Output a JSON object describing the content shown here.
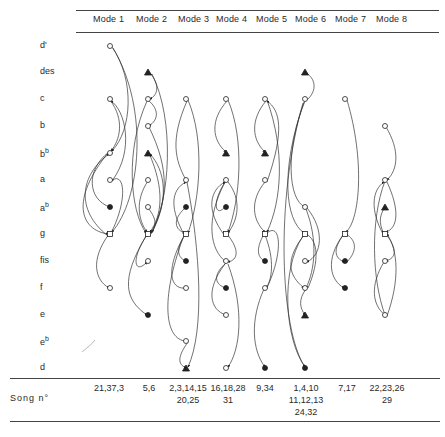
{
  "header": {
    "modes": [
      "Mode 1",
      "Mode 2",
      "Mode 3",
      "Mode 4",
      "Mode 5",
      "Mode 6",
      "Mode 7",
      "Mode 8"
    ]
  },
  "pitches": [
    {
      "name": "d'",
      "base": "d'",
      "sup": ""
    },
    {
      "name": "des",
      "base": "des",
      "sup": ""
    },
    {
      "name": "c",
      "base": "c",
      "sup": ""
    },
    {
      "name": "b",
      "base": "b",
      "sup": ""
    },
    {
      "name": "bb",
      "base": "b",
      "sup": "b"
    },
    {
      "name": "a",
      "base": "a",
      "sup": ""
    },
    {
      "name": "ab",
      "base": "a",
      "sup": "b"
    },
    {
      "name": "g",
      "base": "g",
      "sup": ""
    },
    {
      "name": "fis",
      "base": "fis",
      "sup": ""
    },
    {
      "name": "f",
      "base": "f",
      "sup": ""
    },
    {
      "name": "e",
      "base": "e",
      "sup": ""
    },
    {
      "name": "eb",
      "base": "e",
      "sup": "b"
    },
    {
      "name": "d",
      "base": "d",
      "sup": ""
    }
  ],
  "footer": {
    "song_label": "Song  n°",
    "songs": [
      "21,37,3",
      "5,6",
      "2,3,14,15\n20,25",
      "16,18,28\n31",
      "9,34",
      "1,4,10\n11,12,13\n24,32",
      "7,17",
      "22,23,26\n29"
    ]
  },
  "legend_markers": {
    "open_circle": "tone",
    "filled_circle": "final/end tone",
    "open_square": "central tone",
    "filled_triangle": "upper/lower neighbor"
  },
  "modes": [
    {
      "mode": "Mode 1",
      "nodes": [
        {
          "pitch": "d'",
          "shape": "circle"
        },
        {
          "pitch": "c",
          "shape": "circle"
        },
        {
          "pitch": "bb",
          "shape": "circle"
        },
        {
          "pitch": "a",
          "shape": "circle"
        },
        {
          "pitch": "ab",
          "shape": "filled"
        },
        {
          "pitch": "g",
          "shape": "square"
        },
        {
          "pitch": "f",
          "shape": "circle"
        }
      ]
    },
    {
      "mode": "Mode 2",
      "nodes": [
        {
          "pitch": "des",
          "shape": "triangle"
        },
        {
          "pitch": "c",
          "shape": "circle"
        },
        {
          "pitch": "b",
          "shape": "circle"
        },
        {
          "pitch": "bb",
          "shape": "triangle"
        },
        {
          "pitch": "a",
          "shape": "circle"
        },
        {
          "pitch": "ab",
          "shape": "circle"
        },
        {
          "pitch": "g",
          "shape": "square"
        },
        {
          "pitch": "fis",
          "shape": "circle"
        },
        {
          "pitch": "e",
          "shape": "filled"
        }
      ]
    },
    {
      "mode": "Mode 3",
      "nodes": [
        {
          "pitch": "c",
          "shape": "circle"
        },
        {
          "pitch": "a",
          "shape": "circle"
        },
        {
          "pitch": "ab",
          "shape": "filled"
        },
        {
          "pitch": "g",
          "shape": "square"
        },
        {
          "pitch": "fis",
          "shape": "filled"
        },
        {
          "pitch": "f",
          "shape": "circle"
        },
        {
          "pitch": "e",
          "shape": "circle"
        },
        {
          "pitch": "eb",
          "shape": "circle"
        },
        {
          "pitch": "d",
          "shape": "triangle"
        }
      ]
    },
    {
      "mode": "Mode 4",
      "nodes": [
        {
          "pitch": "c",
          "shape": "circle"
        },
        {
          "pitch": "bb",
          "shape": "triangle"
        },
        {
          "pitch": "a",
          "shape": "circle"
        },
        {
          "pitch": "ab",
          "shape": "filled"
        },
        {
          "pitch": "g",
          "shape": "square"
        },
        {
          "pitch": "fis",
          "shape": "circle"
        },
        {
          "pitch": "f",
          "shape": "filled"
        },
        {
          "pitch": "e",
          "shape": "circle"
        },
        {
          "pitch": "d",
          "shape": "circle"
        }
      ]
    },
    {
      "mode": "Mode 5",
      "nodes": [
        {
          "pitch": "c",
          "shape": "circle"
        },
        {
          "pitch": "bb",
          "shape": "triangle"
        },
        {
          "pitch": "a",
          "shape": "circle"
        },
        {
          "pitch": "g",
          "shape": "square"
        },
        {
          "pitch": "fis",
          "shape": "filled"
        },
        {
          "pitch": "f",
          "shape": "circle"
        },
        {
          "pitch": "d",
          "shape": "filled"
        }
      ]
    },
    {
      "mode": "Mode 6",
      "nodes": [
        {
          "pitch": "des",
          "shape": "triangle"
        },
        {
          "pitch": "c",
          "shape": "circle"
        },
        {
          "pitch": "ab",
          "shape": "circle"
        },
        {
          "pitch": "g",
          "shape": "square"
        },
        {
          "pitch": "fis",
          "shape": "circle"
        },
        {
          "pitch": "f",
          "shape": "circle"
        },
        {
          "pitch": "e",
          "shape": "triangle"
        },
        {
          "pitch": "d",
          "shape": "filled"
        }
      ]
    },
    {
      "mode": "Mode 7",
      "nodes": [
        {
          "pitch": "c",
          "shape": "circle"
        },
        {
          "pitch": "g",
          "shape": "square"
        },
        {
          "pitch": "fis",
          "shape": "filled"
        },
        {
          "pitch": "f",
          "shape": "filled"
        }
      ]
    },
    {
      "mode": "Mode 8",
      "nodes": [
        {
          "pitch": "b",
          "shape": "circle"
        },
        {
          "pitch": "a",
          "shape": "circle"
        },
        {
          "pitch": "ab",
          "shape": "triangle"
        },
        {
          "pitch": "g",
          "shape": "square"
        },
        {
          "pitch": "fis",
          "shape": "circle"
        },
        {
          "pitch": "e",
          "shape": "circle"
        }
      ]
    }
  ]
}
